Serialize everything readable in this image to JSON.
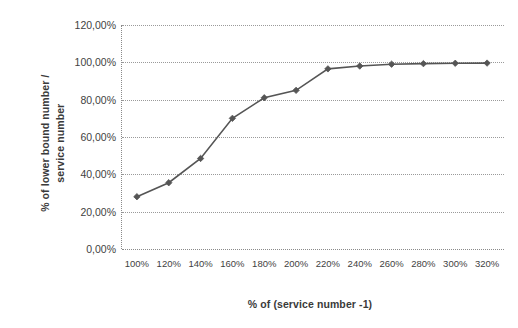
{
  "chart_data": {
    "type": "line",
    "title": "",
    "xlabel": "% of (service number -1)",
    "ylabel": "% of lower bound number / service number",
    "categories": [
      "100%",
      "120%",
      "140%",
      "160%",
      "180%",
      "200%",
      "220%",
      "240%",
      "260%",
      "280%",
      "300%",
      "320%"
    ],
    "x_values": [
      100,
      120,
      140,
      160,
      180,
      200,
      220,
      240,
      260,
      280,
      300,
      320
    ],
    "values": [
      28.0,
      35.5,
      48.5,
      70.0,
      81.0,
      85.0,
      96.5,
      98.0,
      99.0,
      99.3,
      99.5,
      99.6
    ],
    "series": [
      {
        "name": "% of lower bound number / service number",
        "values": [
          28.0,
          35.5,
          48.5,
          70.0,
          81.0,
          85.0,
          96.5,
          98.0,
          99.0,
          99.3,
          99.5,
          99.6
        ],
        "color": "#555555",
        "marker": "diamond"
      }
    ],
    "ylim": [
      0,
      120
    ],
    "ytick_values": [
      0,
      20,
      40,
      60,
      80,
      100,
      120
    ],
    "ytick_labels": [
      "0,00%",
      "20,00%",
      "40,00%",
      "60,00%",
      "80,00%",
      "100,00%",
      "120,00%"
    ],
    "grid": true,
    "grid_style": "dotted-horizontal",
    "legend": false,
    "legend_position": "none",
    "background_color": "#ffffff",
    "axis_color": "#8a8a8a",
    "text_color": "#3f3f3f"
  }
}
